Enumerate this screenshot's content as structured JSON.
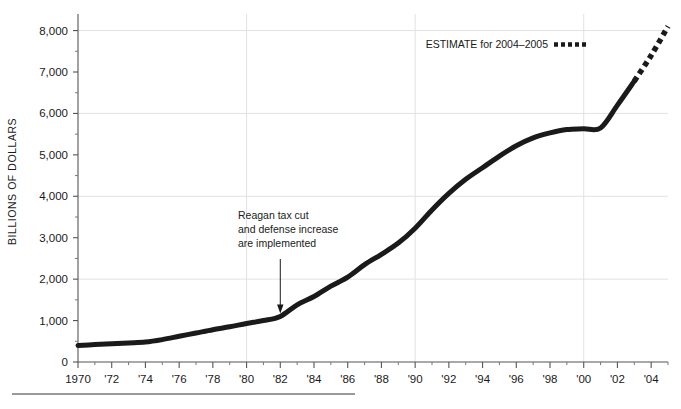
{
  "chart_data": {
    "type": "line",
    "title": "",
    "xlabel": "",
    "ylabel": "BILLIONS OF DOLLARS",
    "xlim": [
      1970,
      2005
    ],
    "ylim": [
      0,
      8400
    ],
    "grid": true,
    "y_gridlines": [
      2000,
      4000,
      6000,
      8000
    ],
    "x_gridlines": [
      1980,
      1990,
      2000
    ],
    "y_ticks": [
      0,
      1000,
      2000,
      3000,
      4000,
      5000,
      6000,
      7000,
      8000
    ],
    "y_tick_labels": [
      "0",
      "1,000",
      "2,000",
      "3,000",
      "4,000",
      "5,000",
      "6,000",
      "7,000",
      "8,000"
    ],
    "x_ticks": [
      1970,
      1972,
      1974,
      1976,
      1978,
      1980,
      1982,
      1984,
      1986,
      1988,
      1990,
      1992,
      1994,
      1996,
      1998,
      2000,
      2002,
      2004
    ],
    "x_tick_labels": [
      "1970",
      "'72",
      "'74",
      "'76",
      "'78",
      "'80",
      "'82",
      "'84",
      "'86",
      "'88",
      "'90",
      "'92",
      "'94",
      "'96",
      "'98",
      "'00",
      "'02",
      "'04"
    ],
    "x_minor_ticks": [
      1971,
      1973,
      1975,
      1977,
      1979,
      1981,
      1983,
      1985,
      1987,
      1989,
      1991,
      1993,
      1995,
      1997,
      1999,
      2001,
      2003,
      2005
    ],
    "series": [
      {
        "name": "Actual",
        "style": "solid",
        "color": "#1a1a1a",
        "x": [
          1970,
          1971,
          1972,
          1973,
          1974,
          1975,
          1976,
          1977,
          1978,
          1979,
          1980,
          1981,
          1982,
          1983,
          1984,
          1985,
          1986,
          1987,
          1988,
          1989,
          1990,
          1991,
          1992,
          1993,
          1994,
          1995,
          1996,
          1997,
          1998,
          1999,
          2000,
          2001,
          2002,
          2003
        ],
        "values": [
          400,
          420,
          440,
          460,
          480,
          540,
          620,
          700,
          780,
          850,
          930,
          1000,
          1100,
          1380,
          1580,
          1830,
          2050,
          2350,
          2600,
          2870,
          3230,
          3670,
          4070,
          4410,
          4690,
          4970,
          5220,
          5410,
          5530,
          5610,
          5630,
          5650,
          6200,
          6780
        ]
      },
      {
        "name": "Estimate",
        "style": "dashed",
        "color": "#1a1a1a",
        "x": [
          2003,
          2004,
          2005
        ],
        "values": [
          6780,
          7400,
          8100
        ]
      }
    ],
    "annotations": [
      {
        "name": "reagan-annotation",
        "lines": [
          "Reagan tax cut",
          "and defense increase",
          "are implemented"
        ],
        "arrow_to_x": 1982,
        "arrow_to_y": 1100
      }
    ],
    "legend": {
      "position": "top-right",
      "label": "ESTIMATE for 2004–2005",
      "swatch": "dashed"
    }
  },
  "figure": {
    "bottom_rule": "",
    "y_axis_title": "BILLIONS OF DOLLARS"
  }
}
